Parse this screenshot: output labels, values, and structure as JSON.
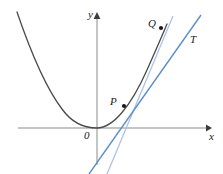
{
  "figure": {
    "background_color": "#ffffff"
  },
  "axes": {
    "x_label": "x",
    "y_label": "y",
    "origin_label": "0",
    "axis_color": "#7d7d7d",
    "x_axis": {
      "x1": 18,
      "y1": 128,
      "x2": 211,
      "y2": 128
    },
    "y_axis": {
      "x1": 97,
      "y1": 165,
      "x2": 97,
      "y2": 12
    }
  },
  "curve": {
    "name": "parabola",
    "color": "#4a4a4a",
    "path": "M 17,12 C 31,52 48,92 65,113 C 74,124 84,128 97,128 C 116,128 138,94 154,56 C 160,42 164,32 167,24",
    "stroke_width": 1.3
  },
  "lines": [
    {
      "name": "secant-line-PQ",
      "label": "",
      "color": "#a9c4e4",
      "stroke_width": 1.2,
      "x1": 172,
      "y1": 18,
      "x2": 108,
      "y2": 174
    },
    {
      "name": "tangent-line-T",
      "label": "T",
      "color": "#5b8fc9",
      "stroke_width": 1.3,
      "x1": 200,
      "y1": 16,
      "x2": 90,
      "y2": 174
    }
  ],
  "points": [
    {
      "name": "point-P",
      "label": "P",
      "cx": 124,
      "cy": 106,
      "r": 2.0,
      "color": "#1a1a1a"
    },
    {
      "name": "point-Q",
      "label": "Q",
      "cx": 161,
      "cy": 28,
      "r": 2.0,
      "color": "#1a1a1a"
    }
  ],
  "arrows": {
    "x_arrow": "M 204,128 L 211,128",
    "y_arrow": "M 97,19 L 97,12",
    "color": "#4a4a4a"
  }
}
